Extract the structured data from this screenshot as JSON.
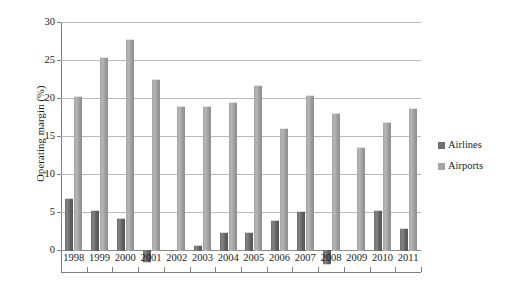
{
  "chart_data": {
    "type": "bar",
    "title": "",
    "xlabel": "",
    "ylabel": "Operating margin (%)",
    "ylim": [
      -5,
      30
    ],
    "yticks": [
      0,
      5,
      10,
      15,
      20,
      25,
      30
    ],
    "ytick_labels": [
      "0",
      "5",
      "10",
      "15",
      "20",
      "25",
      "30"
    ],
    "grid": true,
    "legend_position": "right",
    "categories": [
      "1998",
      "1999",
      "2000",
      "2001",
      "2002",
      "2003",
      "2004",
      "2005",
      "2006",
      "2007",
      "2008",
      "2009",
      "2010",
      "2011"
    ],
    "series": [
      {
        "name": "Airlines",
        "color": "#6f6f6f",
        "values": [
          6.8,
          5.2,
          4.2,
          -1.6,
          0.0,
          0.7,
          2.4,
          2.4,
          4.0,
          5.1,
          -1.8,
          0.0,
          5.3,
          2.9
        ]
      },
      {
        "name": "Airports",
        "color": "#a5a5a5",
        "values": [
          20.3,
          25.4,
          27.7,
          22.5,
          19.0,
          19.0,
          19.5,
          21.7,
          16.0,
          20.4,
          18.0,
          13.6,
          16.8,
          18.7
        ]
      }
    ]
  },
  "legend": {
    "items": [
      {
        "label": "Airlines",
        "swatch": "airlines"
      },
      {
        "label": "Airports",
        "swatch": "airports"
      }
    ]
  }
}
